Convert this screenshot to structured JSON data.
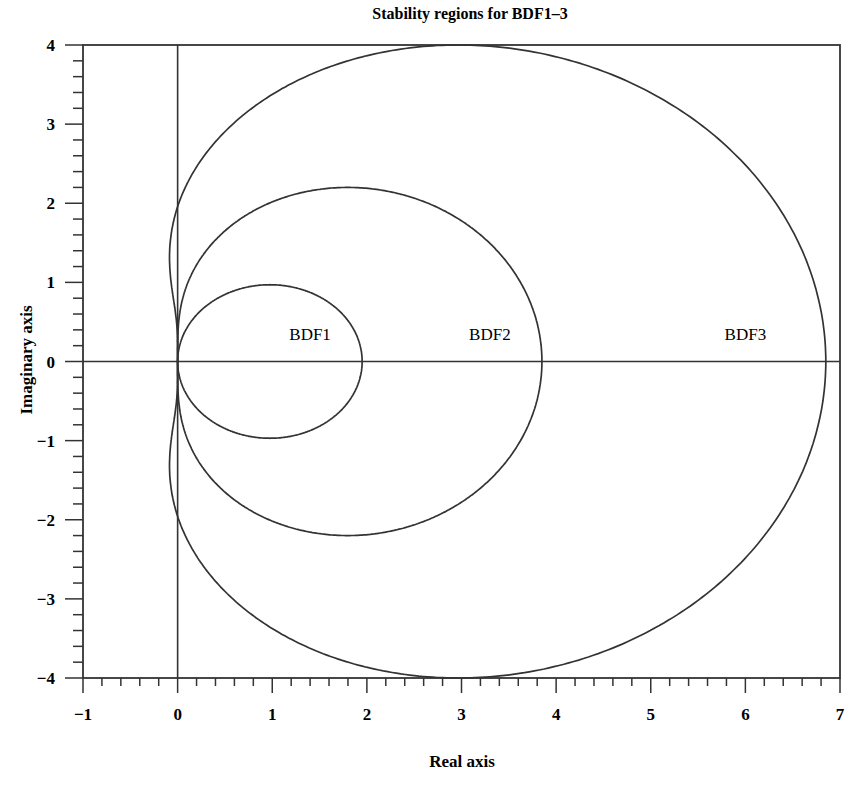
{
  "chart_data": {
    "type": "line",
    "title": "Stability regions for BDF1–3",
    "xlabel": "Real axis",
    "ylabel": "Imaginary axis",
    "xlim": [
      -1,
      7
    ],
    "ylim": [
      -4,
      4
    ],
    "grid": false,
    "x_ticks": [
      "−1",
      "0",
      "1",
      "2",
      "3",
      "4",
      "5",
      "6",
      "7"
    ],
    "y_ticks": [
      "4",
      "3",
      "2",
      "1",
      "0",
      "−1",
      "−2",
      "−3",
      "−4"
    ],
    "x_tick_values": [
      -1,
      0,
      1,
      2,
      3,
      4,
      5,
      6,
      7
    ],
    "y_tick_values": [
      4,
      3,
      2,
      1,
      0,
      -1,
      -2,
      -3,
      -4
    ],
    "minor_ticks_per_unit": 5,
    "reference_lines": {
      "real_axis": "y=0",
      "imaginary_axis": "x=0"
    },
    "series": [
      {
        "name": "BDF1",
        "label": "BDF1",
        "label_pos": [
          1.4,
          0.35
        ],
        "boundary_formula": "z = 1 - e^{-iθ}",
        "coeffs": [
          1,
          -1
        ],
        "approx_extent": {
          "real_max": 1.95,
          "imag_max": 0.97,
          "imag_min": -0.97
        }
      },
      {
        "name": "BDF2",
        "label": "BDF2",
        "label_pos": [
          3.3,
          0.35
        ],
        "boundary_formula": "z = 3/2 - 2e^{-iθ} + 1/2 e^{-2iθ}",
        "coeffs": [
          1.5,
          -2,
          0.5
        ],
        "approx_extent": {
          "real_max": 3.85,
          "imag_max": 2.2,
          "imag_min": -2.2
        }
      },
      {
        "name": "BDF3",
        "label": "BDF3",
        "label_pos": [
          6.0,
          0.35
        ],
        "boundary_formula": "z = 11/6 - 3e^{-iθ} + 3/2 e^{-2iθ} - 1/3 e^{-3iθ}",
        "coeffs": [
          1.8333333,
          -3,
          1.5,
          -0.3333333
        ],
        "approx_extent": {
          "real_max": 6.85,
          "imag_max": 4.0,
          "imag_min": -4.0
        }
      }
    ]
  },
  "colors": {
    "line": "#333333",
    "background": "#ffffff"
  }
}
